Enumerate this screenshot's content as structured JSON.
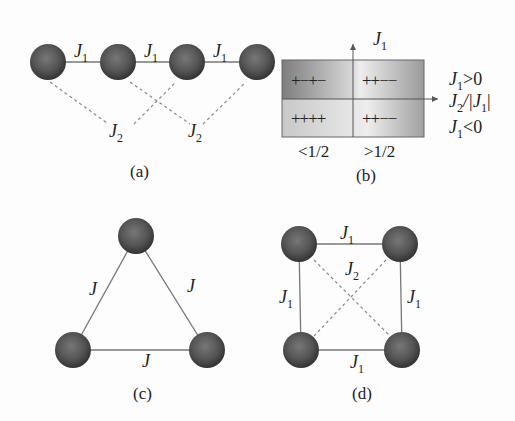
{
  "panels": {
    "a": {
      "caption": "(a)",
      "nn_coupling": "J",
      "nn_sub": "1",
      "nnn_coupling": "J",
      "nnn_sub": "2",
      "sites": 4
    },
    "b": {
      "caption": "(b)",
      "y_axis": "J",
      "y_axis_sub": "1",
      "x_axis": "J",
      "x_axis_sub": "2",
      "x_axis_tail": "/|J",
      "x_axis_tail_sub": "1",
      "x_axis_close": "|",
      "upper_label": "J",
      "upper_label_sub": "1",
      "upper_label_rel": ">0",
      "lower_label": "J",
      "lower_label_sub": "1",
      "lower_label_rel": "<0",
      "cells": {
        "top_left": "+−+−",
        "top_right": "++−−",
        "bottom_left": "++++",
        "bottom_right": "++−−"
      },
      "ticks": [
        "<1/2",
        ">1/2"
      ]
    },
    "c": {
      "caption": "(c)",
      "coupling": "J",
      "sites": 3
    },
    "d": {
      "caption": "(d)",
      "edge_coupling": "J",
      "edge_sub": "1",
      "diag_coupling": "J",
      "diag_sub": "2",
      "sites": 4
    }
  },
  "colors": {
    "node_dark": "#3a3a3a",
    "node_light": "#8a8a8a",
    "line": "#777777",
    "dashed": "#888888"
  }
}
